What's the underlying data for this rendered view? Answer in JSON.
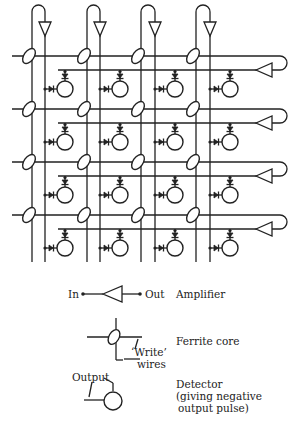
{
  "diagram": {
    "type": "ferrite-core memory matrix",
    "columns": 4,
    "rows": 4,
    "column_left_x": [
      32,
      87,
      141,
      196
    ],
    "column_right_x": [
      45,
      100,
      155,
      210
    ],
    "row_y": [
      56,
      109,
      162,
      215
    ],
    "row_return_offset": 14,
    "loop_top_y": 5,
    "grid_bottom_y": 262,
    "right_loop_x": 287,
    "colors": {
      "ink": "#222222",
      "background": "#ffffff"
    }
  },
  "legend": {
    "amplifier": {
      "in_label": "In",
      "out_label": "Out",
      "description": "Amplifier"
    },
    "ferrite_core": {
      "write_label": "‘Write’",
      "wires_label": "wires",
      "description": "Ferrite core"
    },
    "detector": {
      "output_label": "Output",
      "description_line1": "Detector",
      "description_line2": "(giving negative",
      "description_line3": "output pulse)"
    }
  }
}
